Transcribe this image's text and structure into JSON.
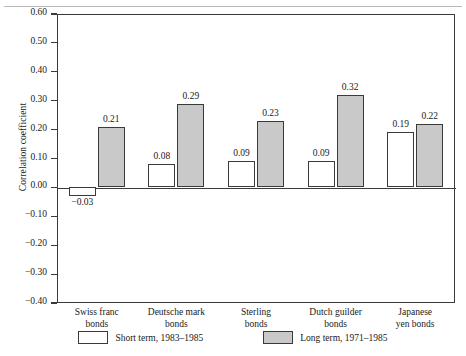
{
  "chart_data": {
    "type": "bar",
    "title": "",
    "xlabel": "",
    "ylabel": "Correlation coefficient",
    "ylim": [
      -0.4,
      0.6
    ],
    "ytick_labels": [
      "0.60",
      "0.50",
      "0.40",
      "0.30",
      "0.20",
      "0.10",
      "0.00",
      "−0.10",
      "−0.20",
      "−0.30",
      "−0.40"
    ],
    "ytick_values": [
      0.6,
      0.5,
      0.4,
      0.3,
      0.2,
      0.1,
      0.0,
      -0.1,
      -0.2,
      -0.3,
      -0.4
    ],
    "grid": false,
    "legend_position": "bottom",
    "categories": [
      "Swiss franc\nbonds",
      "Deutsche mark\nbonds",
      "Sterling\nbonds",
      "Dutch guilder\nbonds",
      "Japanese\nyen bonds"
    ],
    "category_lines": [
      [
        "Swiss franc",
        "bonds"
      ],
      [
        "Deutsche mark",
        "bonds"
      ],
      [
        "Sterling",
        "bonds"
      ],
      [
        "Dutch guilder",
        "bonds"
      ],
      [
        "Japanese",
        "yen bonds"
      ]
    ],
    "series": [
      {
        "name": "Short term, 1983–1985",
        "key": "short",
        "color": "#ffffff",
        "values": [
          -0.03,
          0.08,
          0.09,
          0.09,
          0.19
        ],
        "labels": [
          "−0.03",
          "0.08",
          "0.09",
          "0.09",
          "0.19"
        ]
      },
      {
        "name": "Long term, 1971–1985",
        "key": "long",
        "color": "#c9c9c9",
        "values": [
          0.21,
          0.29,
          0.23,
          0.32,
          0.22
        ],
        "labels": [
          "0.21",
          "0.29",
          "0.23",
          "0.32",
          "0.22"
        ]
      }
    ]
  },
  "legend": {
    "items": [
      {
        "label": "Short term, 1983–1985",
        "key": "short"
      },
      {
        "label": "Long term, 1971–1985",
        "key": "long"
      }
    ]
  },
  "colors": {
    "axis": "#3a3a3a",
    "short_term_fill": "#ffffff",
    "long_term_fill": "#c9c9c9",
    "text": "#1a1a1a"
  }
}
